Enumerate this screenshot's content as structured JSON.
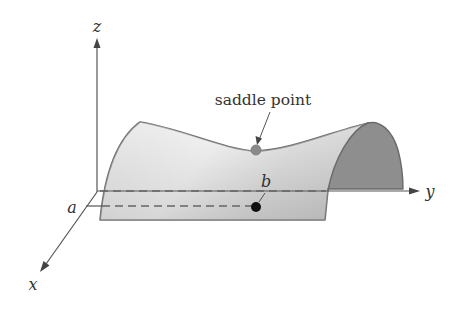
{
  "figure": {
    "type": "saddle surface diagram",
    "labels": {
      "z_axis": "z",
      "y_axis": "y",
      "x_axis": "x",
      "point_a": "a",
      "point_b": "b",
      "saddle_point": "saddle point"
    },
    "colors": {
      "axis": "#555555",
      "surface_light": "#e6e6e6",
      "surface_mid": "#c8c8c8",
      "surface_edge": "#6e6e6e",
      "cap_fill": "#8e8e8e",
      "saddle_marker": "#8a8a8a",
      "point_marker": "#111111",
      "dash": "#666666"
    }
  }
}
